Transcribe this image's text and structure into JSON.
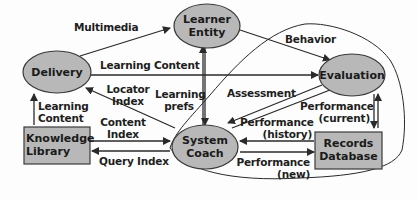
{
  "diagram": {
    "nodes": {
      "learner_entity": {
        "label_line1": "Learner",
        "label_line2": "Entity",
        "shape": "ellipse"
      },
      "delivery": {
        "label": "Delivery",
        "shape": "ellipse"
      },
      "evaluation": {
        "label": "Evaluation",
        "shape": "ellipse"
      },
      "system_coach": {
        "label_line1": "System",
        "label_line2": "Coach",
        "shape": "ellipse"
      },
      "knowledge_library": {
        "label_line1": "Knowledge",
        "label_line2": "Library",
        "shape": "rectangle"
      },
      "records_database": {
        "label_line1": "Records",
        "label_line2": "Database",
        "shape": "rectangle"
      }
    },
    "edges": {
      "multimedia": "Multimedia",
      "behavior": "Behavior",
      "learning_content_top": "Learning Content",
      "locator_index_1": "Locator",
      "locator_index_2": "Index",
      "learning_prefs_1": "Learning",
      "learning_prefs_2": "prefs",
      "assessment": "Assessment",
      "learning_content_left_1": "Learning",
      "learning_content_left_2": "Content",
      "content_index_1": "Content",
      "content_index_2": "Index",
      "query_index": "Query Index",
      "performance_current_1": "Performance",
      "performance_current_2": "(current)",
      "performance_history_1": "Performance",
      "performance_history_2": "(history)",
      "performance_new_1": "Performance",
      "performance_new_2": "(new)"
    },
    "colors": {
      "node_fill": "#b8b8b8",
      "node_stroke": "#3a3a3a",
      "line": "#2a2a2a",
      "text": "#1e1e1e"
    }
  }
}
